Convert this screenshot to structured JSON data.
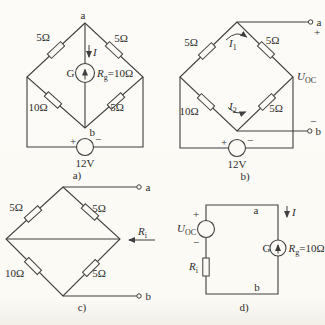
{
  "palette": {
    "line": "#3f3f3f",
    "paper": "#fbfaf5",
    "text": "#2d2d2d"
  },
  "circuit_a": {
    "caption": "a)",
    "node_top": "a",
    "node_bottom": "b",
    "r_top_left": "5Ω",
    "r_top_right": "5Ω",
    "r_bottom_left": "10Ω",
    "r_bottom_right": "5Ω",
    "current_label": "I",
    "galv": {
      "g": "G",
      "r": "R",
      "r_sub": "g",
      "r_eq": "=10Ω"
    },
    "source": {
      "plus": "+",
      "minus": "−",
      "value": "12V"
    }
  },
  "circuit_b": {
    "caption": "b)",
    "node_top": "a",
    "node_bottom": "b",
    "terminal_top_sign": "+",
    "terminal_bottom_sign": "−",
    "r_top_left": "5Ω",
    "r_top_right": "5Ω",
    "r_bottom_left": "10Ω",
    "r_bottom_right": "5Ω",
    "i1": {
      "base": "I",
      "sub": "1"
    },
    "i2": {
      "base": "I",
      "sub": "2"
    },
    "uoc": {
      "base": "U",
      "sub": "OC"
    },
    "source": {
      "plus": "+",
      "minus": "−",
      "value": "12V"
    }
  },
  "circuit_c": {
    "caption": "c)",
    "node_top": "a",
    "node_bottom": "b",
    "r_top_left": "5Ω",
    "r_top_right": "5Ω",
    "r_bottom_left": "10Ω",
    "r_bottom_right": "5Ω",
    "ri": {
      "base": "R",
      "sub": "i"
    }
  },
  "circuit_d": {
    "caption": "d)",
    "node_top": "a",
    "node_bottom": "b",
    "current_label": "I",
    "uoc": {
      "base": "U",
      "sub": "OC",
      "plus": "+",
      "minus": "−"
    },
    "ri": {
      "base": "R",
      "sub": "i"
    },
    "galv": {
      "g": "G",
      "r": "R",
      "r_sub": "g",
      "r_eq": "=10Ω"
    }
  }
}
